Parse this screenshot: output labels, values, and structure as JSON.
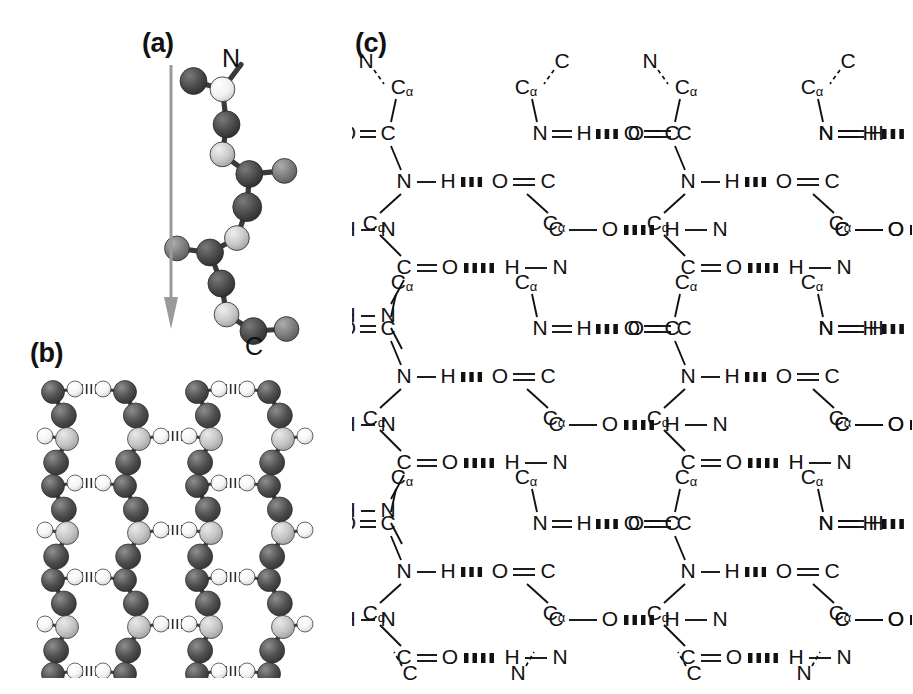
{
  "figure": {
    "panels": [
      {
        "id": "a",
        "label": "(a)",
        "caption": "Extended polypeptide chain ball-and-stick model"
      },
      {
        "id": "b",
        "label": "(b)",
        "caption": "Antiparallel beta-sheet ball-and-stick model"
      },
      {
        "id": "c",
        "label": "(c)",
        "caption": "Antiparallel beta-pleated sheet chemical structure"
      }
    ]
  },
  "panel_a": {
    "label": "(a)",
    "n_terminus_label": "N",
    "c_terminus_label": "C",
    "arrow_direction": "down",
    "arrow_color": "#9a9a9a",
    "atom_colors": {
      "dark": "#4a4a4a",
      "mid": "#7d7d7d",
      "light": "#c9c9c9",
      "white": "#f2f2f2"
    },
    "residue_count": 5,
    "backbone_nodes": [
      {
        "x": 30,
        "y": 30,
        "r": 13,
        "shade": "dark"
      },
      {
        "x": 58,
        "y": 38,
        "r": 12,
        "shade": "white"
      },
      {
        "x": 62,
        "y": 72,
        "r": 13,
        "shade": "dark"
      },
      {
        "x": 58,
        "y": 101,
        "r": 12,
        "shade": "light"
      },
      {
        "x": 84,
        "y": 120,
        "r": 13,
        "shade": "dark"
      },
      {
        "x": 118,
        "y": 117,
        "r": 12,
        "shade": "mid"
      },
      {
        "x": 82,
        "y": 152,
        "r": 14,
        "shade": "dark"
      },
      {
        "x": 72,
        "y": 182,
        "r": 12,
        "shade": "light"
      },
      {
        "x": 46,
        "y": 196,
        "r": 13,
        "shade": "dark"
      },
      {
        "x": 14,
        "y": 192,
        "r": 12,
        "shade": "mid"
      },
      {
        "x": 57,
        "y": 226,
        "r": 13,
        "shade": "dark"
      },
      {
        "x": 62,
        "y": 256,
        "r": 12,
        "shade": "light"
      },
      {
        "x": 88,
        "y": 272,
        "r": 13,
        "shade": "dark"
      },
      {
        "x": 120,
        "y": 270,
        "r": 12,
        "shade": "mid"
      }
    ]
  },
  "panel_b": {
    "label": "(b)",
    "strand_count": 4,
    "rung_count": 6,
    "hbond_style": "hatched",
    "atom_colors": {
      "dark": "#4f4f4f",
      "mid": "#8a8a8a",
      "light": "#c4c4c4",
      "white": "#fbfbfb"
    },
    "sheet_type": "antiparallel"
  },
  "panel_c": {
    "label": "(c)",
    "sheet_type": "antiparallel beta-pleated sheet",
    "strand_count": 4,
    "top_terminals": [
      "N",
      "C",
      "N",
      "C"
    ],
    "bottom_terminals": [
      "C",
      "N",
      "C",
      "N"
    ],
    "atoms": {
      "alpha_carbon": "C",
      "alpha_subscript": "α",
      "carbonyl_carbon": "C",
      "nitrogen": "N",
      "oxygen": "O",
      "hydrogen": "H"
    },
    "bond_types": {
      "single": "line",
      "double": "double-line",
      "hydrogen": "hatched-bar",
      "continuation": "dashed-line"
    },
    "left_edge_groups": [
      "O=C",
      "H-N"
    ],
    "right_edge_groups": [
      "N=H",
      "C-O"
    ],
    "repeat_unit_height_px": 195,
    "strand_x_positions": [
      36,
      188,
      320,
      474
    ]
  }
}
